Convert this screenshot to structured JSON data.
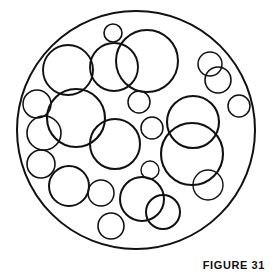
{
  "figure": {
    "caption": "FIGURE 31",
    "canvas": {
      "width": 273,
      "height": 279
    },
    "style": {
      "background_color": "#ffffff",
      "stroke_color": "#111111",
      "fill": "none"
    },
    "boundary_circle": {
      "name": "outer-boundary-circle",
      "cx": 136,
      "cy": 130,
      "r": 119,
      "stroke_width": 2.0
    },
    "inner_circles": [
      {
        "id": "c01",
        "cx": 113,
        "cy": 33,
        "r": 9,
        "stroke_width": 1.6
      },
      {
        "id": "c02",
        "cx": 147,
        "cy": 61,
        "r": 31,
        "stroke_width": 2.0
      },
      {
        "id": "c03",
        "cx": 114,
        "cy": 67,
        "r": 24,
        "stroke_width": 1.9
      },
      {
        "id": "c04",
        "cx": 68,
        "cy": 70,
        "r": 25,
        "stroke_width": 1.9
      },
      {
        "id": "c05",
        "cx": 210,
        "cy": 64,
        "r": 12,
        "stroke_width": 1.5
      },
      {
        "id": "c06",
        "cx": 218,
        "cy": 80,
        "r": 13,
        "stroke_width": 1.6
      },
      {
        "id": "c07",
        "cx": 37,
        "cy": 104,
        "r": 14,
        "stroke_width": 1.5
      },
      {
        "id": "c08",
        "cx": 239,
        "cy": 106,
        "r": 11,
        "stroke_width": 1.5
      },
      {
        "id": "c09",
        "cx": 139,
        "cy": 102,
        "r": 11,
        "stroke_width": 1.5
      },
      {
        "id": "c10",
        "cx": 76,
        "cy": 118,
        "r": 29,
        "stroke_width": 2.1
      },
      {
        "id": "c11",
        "cx": 44,
        "cy": 133,
        "r": 17,
        "stroke_width": 1.6
      },
      {
        "id": "c12",
        "cx": 152,
        "cy": 128,
        "r": 11,
        "stroke_width": 1.5
      },
      {
        "id": "c13",
        "cx": 193,
        "cy": 122,
        "r": 26,
        "stroke_width": 2.1
      },
      {
        "id": "c14",
        "cx": 192,
        "cy": 154,
        "r": 31,
        "stroke_width": 2.1
      },
      {
        "id": "c15",
        "cx": 115,
        "cy": 144,
        "r": 25,
        "stroke_width": 2.0
      },
      {
        "id": "c16",
        "cx": 41,
        "cy": 164,
        "r": 14,
        "stroke_width": 1.6
      },
      {
        "id": "c17",
        "cx": 69,
        "cy": 186,
        "r": 20,
        "stroke_width": 2.0
      },
      {
        "id": "c18",
        "cx": 150,
        "cy": 170,
        "r": 9,
        "stroke_width": 1.4
      },
      {
        "id": "c19",
        "cx": 208,
        "cy": 185,
        "r": 15,
        "stroke_width": 1.4
      },
      {
        "id": "c20",
        "cx": 101,
        "cy": 193,
        "r": 13,
        "stroke_width": 1.5
      },
      {
        "id": "c21",
        "cx": 142,
        "cy": 199,
        "r": 22,
        "stroke_width": 2.0
      },
      {
        "id": "c22",
        "cx": 163,
        "cy": 212,
        "r": 17,
        "stroke_width": 2.0
      },
      {
        "id": "c23",
        "cx": 111,
        "cy": 226,
        "r": 13,
        "stroke_width": 1.6
      }
    ],
    "counts": {
      "total_circles": 24,
      "inner_circles": 23
    }
  }
}
